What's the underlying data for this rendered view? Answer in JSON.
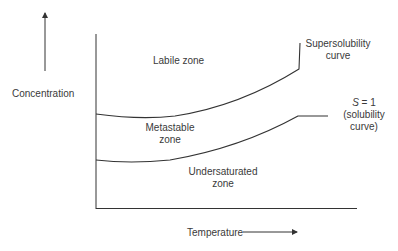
{
  "diagram": {
    "type": "solubility-supersolubility diagram",
    "axes": {
      "y_label": "Concentration",
      "x_label": "Temperature"
    },
    "zones": [
      {
        "id": "labile",
        "label": "Labile zone"
      },
      {
        "id": "metastable",
        "label_line1": "Metastable",
        "label_line2": "zone"
      },
      {
        "id": "undersaturated",
        "label_line1": "Undersaturated",
        "label_line2": "zone"
      }
    ],
    "curves": [
      {
        "id": "supersolubility",
        "label_line1": "Supersolubility",
        "label_line2": "curve"
      },
      {
        "id": "solubility",
        "label_line1_var": "S",
        "label_line1_rest": " = 1",
        "label_line2": "(solubility",
        "label_line3": "curve)"
      }
    ],
    "colors": {
      "line": "#333333",
      "text": "#3a3a3a",
      "background": "#ffffff"
    }
  }
}
